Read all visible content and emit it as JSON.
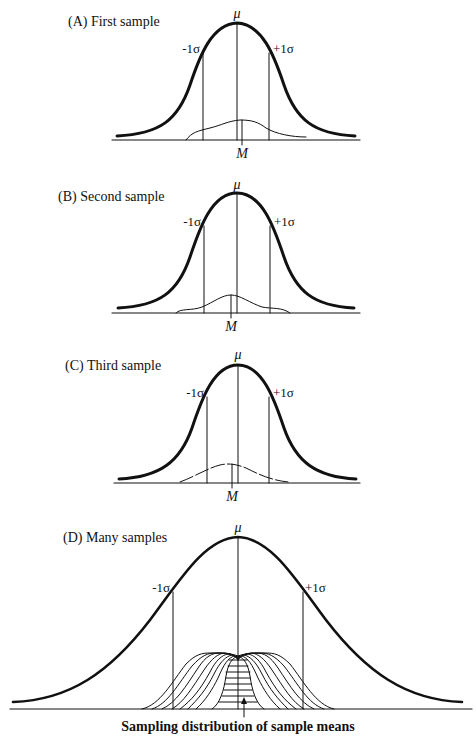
{
  "panels": [
    {
      "id": "A",
      "label": "(A) First sample",
      "mu": "μ",
      "minus_sigma": "-1σ",
      "plus_sigma": "+1σ",
      "mean_label": "M"
    },
    {
      "id": "B",
      "label": "(B) Second sample",
      "mu": "μ",
      "minus_sigma": "-1σ",
      "plus_sigma": "+1σ",
      "mean_label": "M"
    },
    {
      "id": "C",
      "label": "(C) Third sample",
      "mu": "μ",
      "minus_sigma": "-1σ",
      "plus_sigma": "+1σ",
      "mean_label": "M"
    },
    {
      "id": "D",
      "label": "(D) Many samples",
      "mu": "μ",
      "minus_sigma": "-1σ",
      "plus_sigma": "+1σ",
      "caption": "Sampling distribution of sample means"
    }
  ],
  "colors": {
    "ink": "#111111",
    "background": "#ffffff"
  }
}
